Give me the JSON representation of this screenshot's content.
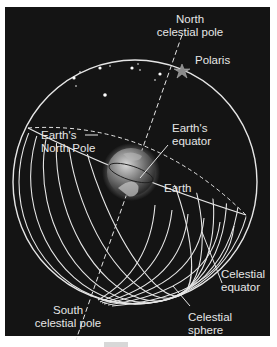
{
  "diagram": {
    "labels": {
      "north_celestial_pole_line1": "North",
      "north_celestial_pole_line2": "celestial pole",
      "polaris": "Polaris",
      "earths_north_pole_line1": "Earth's",
      "earths_north_pole_line2": "North Pole",
      "earths_equator_line1": "Earth's",
      "earths_equator_line2": "equator",
      "earth": "Earth",
      "celestial_equator_line1": "Celestial",
      "celestial_equator_line2": "equator",
      "south_celestial_pole_line1": "South",
      "south_celestial_pole_line2": "celestial pole",
      "celestial_sphere_line1": "Celestial",
      "celestial_sphere_line2": "sphere"
    },
    "colors": {
      "background": "#141414",
      "lines": "#e6e6e6",
      "polaris_star": "#8a8a8a",
      "earth_globe": "#7a7a7a"
    }
  }
}
